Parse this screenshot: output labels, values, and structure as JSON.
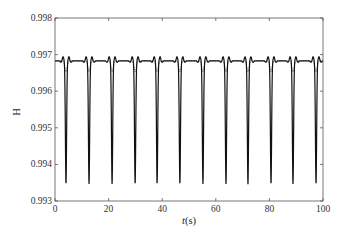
{
  "chart_data": {
    "type": "line",
    "title": "",
    "xlabel": "t(s)",
    "ylabel": "H",
    "xlim": [
      0,
      100
    ],
    "ylim": [
      0.993,
      0.998
    ],
    "xticks": [
      0,
      20,
      40,
      60,
      80,
      100
    ],
    "yticks": [
      0.993,
      0.994,
      0.995,
      0.996,
      0.997,
      0.998
    ],
    "ytick_labels": [
      "0.993",
      "0.994",
      "0.995",
      "0.996",
      "0.997",
      "0.998"
    ],
    "xtick_labels": [
      "0",
      "20",
      "40",
      "60",
      "80",
      "100"
    ],
    "grid": false,
    "legend": null,
    "period_s": 8.5,
    "dip_times": [
      4.1,
      12.7,
      21.3,
      29.9,
      38.1,
      46.6,
      55.2,
      63.8,
      72.0,
      80.6,
      88.8,
      97.4
    ],
    "series": [
      {
        "name": "solid",
        "style": "solid",
        "baseline": 0.99683,
        "shoulder_peak": 0.99694,
        "dip_min": 0.99346
      },
      {
        "name": "dashed",
        "style": "dashed",
        "baseline": 0.99683,
        "dip_min": 0.99653
      }
    ]
  }
}
